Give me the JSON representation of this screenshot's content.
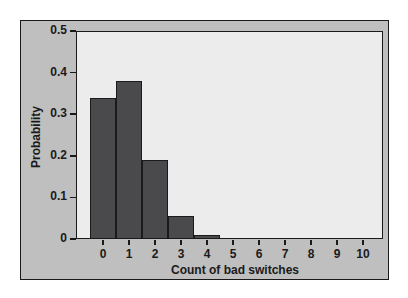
{
  "chart_data": {
    "type": "bar",
    "title": "",
    "xlabel": "Count of bad switches",
    "ylabel": "Probability",
    "categories": [
      "0",
      "1",
      "2",
      "3",
      "4",
      "5",
      "6",
      "7",
      "8",
      "9",
      "10"
    ],
    "values": [
      0.34,
      0.38,
      0.19,
      0.055,
      0.01,
      0.0,
      0.0,
      0.0,
      0.0,
      0.0,
      0.0
    ],
    "ylim": [
      0,
      0.5
    ],
    "yticks": [
      "0",
      "0.1",
      "0.2",
      "0.3",
      "0.4",
      "0.5"
    ],
    "grid": false,
    "legend": null,
    "colors": {
      "bar": "#4a4a4c",
      "plot_bg": "#ececec",
      "frame_bg": "#bfbfbf"
    }
  }
}
